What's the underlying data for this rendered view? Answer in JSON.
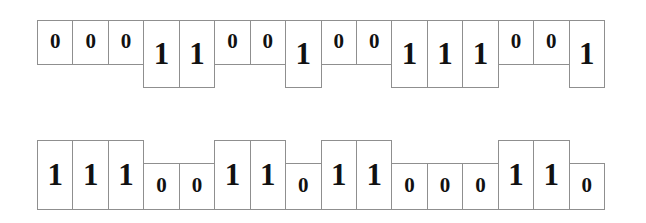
{
  "figure": {
    "kind": "binary-sequence-bar-diagram",
    "background_color": "#ffffff",
    "box_border_color": "#8f8f8f",
    "digit_color": "#111111",
    "bit_count_per_row": 16,
    "row_count": 2
  },
  "rows": [
    {
      "name": "top-sequence",
      "alignment": "top",
      "bits": [
        "0",
        "0",
        "0",
        "1",
        "1",
        "0",
        "0",
        "1",
        "0",
        "0",
        "1",
        "1",
        "1",
        "0",
        "0",
        "1"
      ],
      "sequence_string": "0001100100111001"
    },
    {
      "name": "bottom-sequence",
      "alignment": "bottom",
      "bits": [
        "1",
        "1",
        "1",
        "0",
        "0",
        "1",
        "1",
        "0",
        "1",
        "1",
        "0",
        "0",
        "0",
        "1",
        "1",
        "0"
      ],
      "sequence_string": "1110011011000110"
    }
  ]
}
